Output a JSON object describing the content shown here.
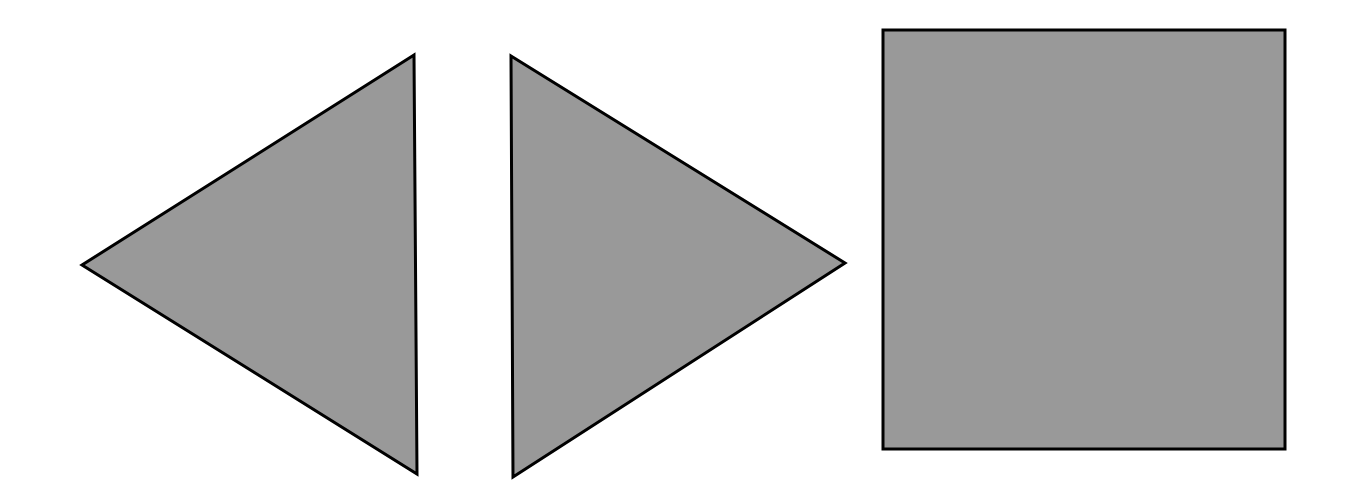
{
  "canvas": {
    "width": 1356,
    "height": 492,
    "background_color": "#ffffff",
    "title": "Geometric Shapes Figure"
  },
  "style": {
    "fill_color": "#999999",
    "stroke_color": "#000000",
    "stroke_width": 3
  },
  "shapes": [
    {
      "id": "triangle-left-pointing",
      "name": "Left-pointing triangle",
      "type": "triangle",
      "orientation": "points-left",
      "fill": "#999999",
      "stroke": "#000000",
      "stroke_width": 3,
      "points": "414,55 82,265 417,474",
      "vertices": [
        {
          "x": 414,
          "y": 55,
          "label": "top-right-vertex"
        },
        {
          "x": 82,
          "y": 265,
          "label": "left-apex-vertex"
        },
        {
          "x": 417,
          "y": 474,
          "label": "bottom-right-vertex"
        }
      ]
    },
    {
      "id": "triangle-right-pointing",
      "name": "Right-pointing triangle",
      "type": "triangle",
      "orientation": "points-right",
      "fill": "#999999",
      "stroke": "#000000",
      "stroke_width": 3,
      "points": "511,56 845,263 513,477",
      "vertices": [
        {
          "x": 511,
          "y": 56,
          "label": "top-left-vertex"
        },
        {
          "x": 845,
          "y": 263,
          "label": "right-apex-vertex"
        },
        {
          "x": 513,
          "y": 477,
          "label": "bottom-left-vertex"
        }
      ]
    },
    {
      "id": "square",
      "name": "Square",
      "type": "rectangle",
      "orientation": "upright",
      "fill": "#999999",
      "stroke": "#000000",
      "stroke_width": 3,
      "x": 883,
      "y": 30,
      "width": 402,
      "height": 419,
      "vertices": [
        {
          "x": 883,
          "y": 30,
          "label": "top-left-corner"
        },
        {
          "x": 1285,
          "y": 30,
          "label": "top-right-corner"
        },
        {
          "x": 1285,
          "y": 449,
          "label": "bottom-right-corner"
        },
        {
          "x": 883,
          "y": 449,
          "label": "bottom-left-corner"
        }
      ]
    }
  ]
}
